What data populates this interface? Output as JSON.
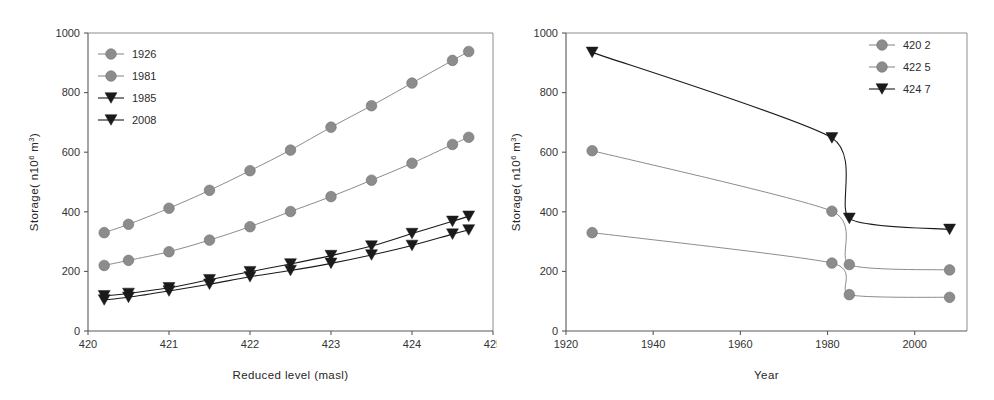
{
  "figure": {
    "name": "reservoir-storage-curves",
    "panel_count": 2,
    "background": "#ffffff"
  },
  "colors": {
    "grey_marker": "#8c8c8c",
    "grey_line": "#8c8c8c",
    "black_marker": "#1a1a1a",
    "black_line": "#1a1a1a",
    "axis": "#58585a",
    "frame": "#8d8d90",
    "text": "#2b2b2b"
  },
  "left_panel": {
    "y_axis_title": "Storage( n10",
    "y_axis_title_sup1": "6",
    "y_axis_title_mid": " m",
    "y_axis_title_sup2": "3",
    "y_axis_title_end": ")",
    "x_axis_title": "Reduced level (masl)",
    "x_ticks": [
      "420",
      "421",
      "422",
      "423",
      "424",
      "425"
    ],
    "y_ticks": [
      "0",
      "200",
      "400",
      "600",
      "800",
      "1000"
    ],
    "legend": [
      {
        "label": "1926",
        "marker": "circle",
        "color": "#8c8c8c"
      },
      {
        "label": "1981",
        "marker": "circle",
        "color": "#8c8c8c"
      },
      {
        "label": "1985",
        "marker": "triangle-down",
        "color": "#1a1a1a"
      },
      {
        "label": "2008",
        "marker": "triangle-down",
        "color": "#1a1a1a"
      }
    ]
  },
  "right_panel": {
    "y_axis_title": "Storage( n10",
    "y_axis_title_sup1": "6",
    "y_axis_title_mid": " m",
    "y_axis_title_sup2": "3",
    "y_axis_title_end": ")",
    "x_axis_title": "Year",
    "x_ticks": [
      "1920",
      "1940",
      "1960",
      "1980",
      "2000"
    ],
    "y_ticks": [
      "0",
      "200",
      "400",
      "600",
      "800",
      "1000"
    ],
    "legend": [
      {
        "label": "420 2",
        "marker": "circle",
        "color": "#8c8c8c"
      },
      {
        "label": "422 5",
        "marker": "circle",
        "color": "#8c8c8c"
      },
      {
        "label": "424 7",
        "marker": "triangle-down",
        "color": "#1a1a1a"
      }
    ]
  },
  "chart_data": [
    {
      "type": "line",
      "panel": "left",
      "title": "",
      "xlabel": "Reduced level (masl)",
      "ylabel": "Storage( n10^6 m^3)",
      "xlim": [
        420,
        425
      ],
      "ylim": [
        0,
        1000
      ],
      "xticks": [
        420,
        421,
        422,
        423,
        424,
        425
      ],
      "yticks": [
        0,
        200,
        400,
        600,
        800,
        1000
      ],
      "grid": false,
      "legend_position": "top-left",
      "x": [
        420.2,
        420.5,
        421.0,
        421.5,
        422.0,
        422.5,
        423.0,
        423.5,
        424.0,
        424.5,
        424.7
      ],
      "series": [
        {
          "name": "1926",
          "marker": "circle",
          "color": "#8c8c8c",
          "values": [
            330,
            358,
            412,
            472,
            538,
            607,
            684,
            756,
            832,
            908,
            938
          ]
        },
        {
          "name": "1981",
          "marker": "circle",
          "color": "#8c8c8c",
          "values": [
            220,
            237,
            266,
            305,
            350,
            401,
            451,
            506,
            563,
            626,
            650
          ]
        },
        {
          "name": "1985",
          "marker": "triangle-down",
          "color": "#1a1a1a",
          "values": [
            118,
            126,
            145,
            172,
            199,
            225,
            253,
            285,
            327,
            368,
            385
          ]
        },
        {
          "name": "2008",
          "marker": "triangle-down",
          "color": "#1a1a1a",
          "values": [
            104,
            113,
            134,
            157,
            182,
            203,
            227,
            255,
            287,
            325,
            339
          ]
        }
      ]
    },
    {
      "type": "line",
      "panel": "right",
      "title": "",
      "xlabel": "Year",
      "ylabel": "Storage( n10^6 m^3)",
      "xlim": [
        1920,
        2012
      ],
      "ylim": [
        0,
        1000
      ],
      "xticks": [
        1920,
        1940,
        1960,
        1980,
        2000
      ],
      "yticks": [
        0,
        200,
        400,
        600,
        800,
        1000
      ],
      "grid": false,
      "legend_position": "top-right",
      "x": [
        1926,
        1981,
        1985,
        2008
      ],
      "series": [
        {
          "name": "420 2",
          "marker": "circle",
          "color": "#8c8c8c",
          "values": [
            330,
            228,
            122,
            113
          ]
        },
        {
          "name": "422 5",
          "marker": "circle",
          "color": "#8c8c8c",
          "values": [
            605,
            402,
            223,
            205
          ]
        },
        {
          "name": "424 7",
          "marker": "triangle-down",
          "color": "#1a1a1a",
          "values": [
            935,
            648,
            378,
            341
          ]
        }
      ]
    }
  ]
}
